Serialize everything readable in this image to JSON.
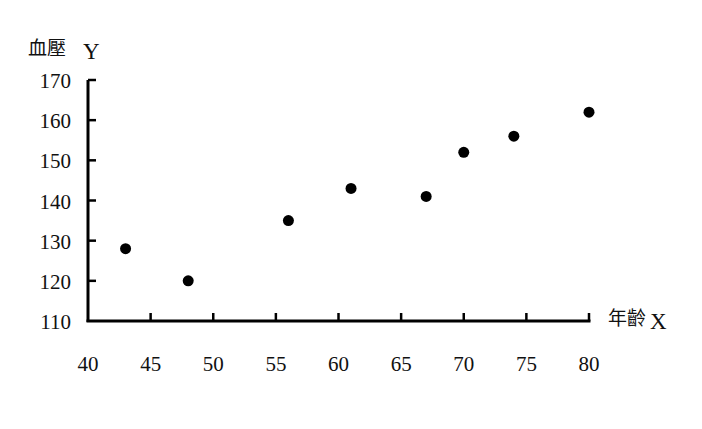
{
  "chart_data": {
    "type": "scatter",
    "title": "",
    "xlabel": "年齡 X",
    "ylabel": "血壓 Y",
    "xlabel_parts": {
      "cjk": "年齡",
      "letter": "X"
    },
    "ylabel_parts": {
      "cjk": "血壓",
      "letter": "Y"
    },
    "xlim": [
      40,
      80
    ],
    "ylim": [
      110,
      170
    ],
    "x_ticks": [
      40,
      45,
      50,
      55,
      60,
      65,
      70,
      75,
      80
    ],
    "y_ticks": [
      110,
      120,
      130,
      140,
      150,
      160,
      170
    ],
    "grid": false,
    "legend": null,
    "series": [
      {
        "name": "血壓 vs 年齡",
        "marker": "filled-circle",
        "color": "#000000",
        "points": [
          {
            "x": 43,
            "y": 128
          },
          {
            "x": 48,
            "y": 120
          },
          {
            "x": 56,
            "y": 135
          },
          {
            "x": 61,
            "y": 143
          },
          {
            "x": 67,
            "y": 141
          },
          {
            "x": 70,
            "y": 152
          },
          {
            "x": 74,
            "y": 156
          },
          {
            "x": 80,
            "y": 162
          }
        ]
      }
    ]
  },
  "colors": {
    "axis": "#000000",
    "marker": "#000000",
    "text": "#111111",
    "background": "#ffffff"
  }
}
